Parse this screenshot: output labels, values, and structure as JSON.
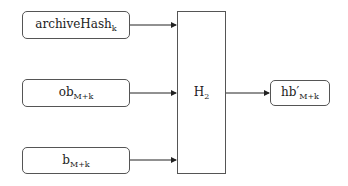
{
  "diagram": {
    "inputs": [
      {
        "label": "archiveHash",
        "subscript": "k"
      },
      {
        "label": "ob",
        "subscript": "M+k"
      },
      {
        "label": "b",
        "subscript": "M+k"
      }
    ],
    "function": {
      "label": "H",
      "subscript": "2"
    },
    "output": {
      "label": "hb′",
      "subscript": "M+k"
    },
    "edges": [
      {
        "from": "archiveHash_k",
        "to": "H_2"
      },
      {
        "from": "ob_M+k",
        "to": "H_2"
      },
      {
        "from": "b_M+k",
        "to": "H_2"
      },
      {
        "from": "H_2",
        "to": "hb′_M+k"
      }
    ]
  }
}
